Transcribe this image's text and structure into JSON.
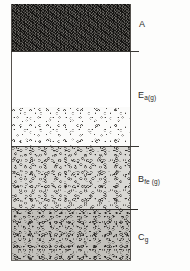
{
  "figure": {
    "name": "soil-profile-diagram",
    "type": "soil-horizon-profile",
    "orientation": "vertical",
    "background_color": "#fdfdfc"
  },
  "chart_data": {
    "type": "bar",
    "title": "",
    "xlabel": "",
    "ylabel": "",
    "categories": [
      "A",
      "Ea(g)",
      "Bfe (g)",
      "Cg"
    ],
    "values": [
      47,
      95,
      63,
      51
    ],
    "units": "pixels depth",
    "grid": false,
    "legend": "none",
    "horizons": [
      {
        "label_main": "A",
        "label_sub": "",
        "top": 4,
        "height": 47,
        "fill_color": "#151412",
        "texture": "dark-fine-speckle"
      },
      {
        "label_main": "E",
        "label_sub": "a(g)",
        "top": 51,
        "height": 95,
        "fill_color": "#ffffff",
        "texture": "blank-upper-mottled-lower"
      },
      {
        "label_main": "B",
        "label_sub": "fe (g)",
        "top": 146,
        "height": 63,
        "fill_color": "#d9d8d4",
        "texture": "light-gray-ring-mottles"
      },
      {
        "label_main": "C",
        "label_sub": "g",
        "top": 209,
        "height": 51,
        "fill_color": "#c2c0bb",
        "texture": "mid-gray-dense-mottles"
      }
    ]
  },
  "labels": {
    "a": {
      "main": "A",
      "sub": ""
    },
    "e": {
      "main": "E",
      "sub": "a(g)"
    },
    "b": {
      "main": "B",
      "sub": "fe (g)"
    },
    "c": {
      "main": "C",
      "sub": "g"
    }
  },
  "colors": {
    "horizon_a": "#151412",
    "horizon_e": "#ffffff",
    "horizon_b": "#d9d8d4",
    "horizon_c": "#c2c0bb",
    "boundary_line": "#3a3835",
    "label_text": "#2b2a28"
  }
}
